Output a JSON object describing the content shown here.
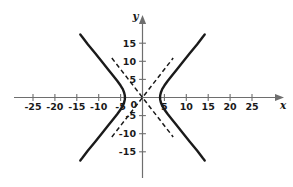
{
  "figure": {
    "title": "",
    "axis_x_label": "x",
    "axis_y_label": "y",
    "origin_label": "0"
  },
  "chart_data": {
    "type": "line",
    "title": "",
    "xlabel": "x",
    "ylabel": "y",
    "grid": false,
    "legend": null,
    "xlim": [
      -28,
      28
    ],
    "ylim": [
      -18,
      18
    ],
    "xticks": [
      -25,
      -20,
      -15,
      -10,
      -5,
      5,
      10,
      15,
      20,
      25
    ],
    "yticks": [
      15,
      10,
      5,
      -5,
      -10,
      -15
    ],
    "xtick_labels": [
      "-25",
      "-20",
      "-15",
      "-10",
      "-5",
      "5",
      "10",
      "15",
      "20",
      "25"
    ],
    "ytick_labels": [
      "15",
      "10",
      "5",
      "-5",
      "-10",
      "-15"
    ],
    "origin_tick_label": "0",
    "series": [
      {
        "name": "hyperbola-right-branch",
        "style": "solid",
        "color": "#1a1a1a",
        "points": [
          [
            4.0,
            0.0
          ],
          [
            4.05,
            0.6
          ],
          [
            4.2,
            1.4
          ],
          [
            4.5,
            2.3
          ],
          [
            5.0,
            3.3
          ],
          [
            5.7,
            4.5
          ],
          [
            6.6,
            5.9
          ],
          [
            7.8,
            7.7
          ],
          [
            9.2,
            9.8
          ],
          [
            10.8,
            12.2
          ],
          [
            12.5,
            14.7
          ],
          [
            13.8,
            16.8
          ],
          [
            14.2,
            17.4
          ]
        ],
        "mirrored_y": true
      },
      {
        "name": "hyperbola-left-branch",
        "style": "solid",
        "color": "#1a1a1a",
        "points": [
          [
            -4.0,
            0.0
          ],
          [
            -4.05,
            0.6
          ],
          [
            -4.2,
            1.4
          ],
          [
            -4.5,
            2.3
          ],
          [
            -5.0,
            3.3
          ],
          [
            -5.7,
            4.5
          ],
          [
            -6.6,
            5.9
          ],
          [
            -7.8,
            7.7
          ],
          [
            -9.2,
            9.8
          ],
          [
            -10.8,
            12.2
          ],
          [
            -12.5,
            14.7
          ],
          [
            -13.8,
            16.8
          ],
          [
            -14.2,
            17.4
          ]
        ],
        "mirrored_y": true
      },
      {
        "name": "asymptote-positive-slope",
        "style": "dashed",
        "color": "#1a1a1a",
        "slope": 1.55,
        "points": [
          [
            -7.0,
            -10.9
          ],
          [
            7.0,
            10.9
          ]
        ]
      },
      {
        "name": "asymptote-negative-slope",
        "style": "dashed",
        "color": "#1a1a1a",
        "slope": -1.55,
        "points": [
          [
            -7.0,
            10.9
          ],
          [
            7.0,
            -10.9
          ]
        ]
      }
    ],
    "vertices": [
      [
        -4,
        0
      ],
      [
        4,
        0
      ]
    ],
    "asymptote_slopes": [
      1.55,
      -1.55
    ]
  },
  "colors": {
    "axis": "#6e6e6e",
    "curve": "#1a1a1a",
    "asymptote": "#1a1a1a",
    "background": "#ffffff",
    "text": "#1a1a1a"
  }
}
